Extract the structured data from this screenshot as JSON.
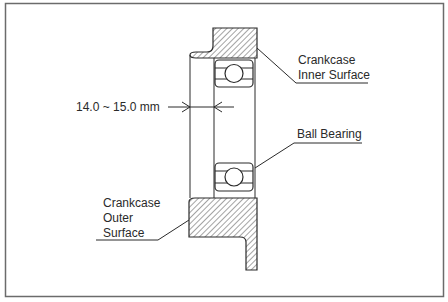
{
  "diagram": {
    "dimension_label": "14.0 ~ 15.0 mm",
    "labels": {
      "inner_surface": [
        "Crankcase",
        "Inner Surface"
      ],
      "ball_bearing": "Ball Bearing",
      "outer_surface": [
        "Crankcase",
        "Outer",
        "Surface"
      ]
    },
    "colors": {
      "line": "#2a2a2a",
      "hatch": "#4a4a4a",
      "frame": "#6b6b6b",
      "background": "#ffffff"
    }
  }
}
